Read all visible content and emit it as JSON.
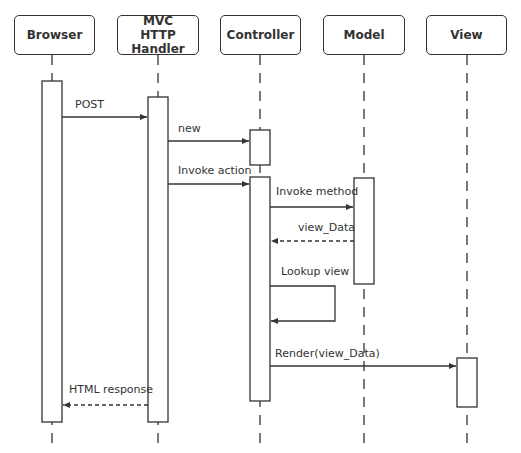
{
  "diagram": {
    "type": "sequence",
    "participants": [
      {
        "id": "browser",
        "label": "Browser"
      },
      {
        "id": "handler",
        "label_line1": "MVC",
        "label_line2": "HTTP Handler"
      },
      {
        "id": "controller",
        "label": "Controller"
      },
      {
        "id": "model",
        "label": "Model"
      },
      {
        "id": "view",
        "label": "View"
      }
    ],
    "messages": [
      {
        "from": "browser",
        "to": "handler",
        "label": "POST",
        "style": "solid"
      },
      {
        "from": "handler",
        "to": "controller",
        "label": "new",
        "style": "solid"
      },
      {
        "from": "handler",
        "to": "controller",
        "label": "Invoke action",
        "style": "solid"
      },
      {
        "from": "controller",
        "to": "model",
        "label": "Invoke method",
        "style": "solid"
      },
      {
        "from": "model",
        "to": "controller",
        "label": "view_Data",
        "style": "dashed"
      },
      {
        "from": "controller",
        "to": "controller",
        "label": "Lookup view",
        "style": "solid"
      },
      {
        "from": "controller",
        "to": "view",
        "label": "Render(view_Data)",
        "style": "solid"
      },
      {
        "from": "handler",
        "to": "browser",
        "label": "HTML response",
        "style": "dashed"
      }
    ]
  }
}
